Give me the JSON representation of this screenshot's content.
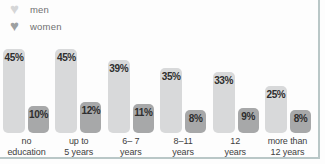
{
  "legend": {
    "items": [
      {
        "label": "men",
        "icon": "heart-icon",
        "color": "#d5d6d7"
      },
      {
        "label": "women",
        "icon": "heart-icon",
        "color": "#9da0a1"
      }
    ]
  },
  "chart_data": {
    "type": "bar",
    "categories": [
      "no education",
      "up to 5 years",
      "6– 7 years",
      "8–11 years",
      "12 years",
      "more than 12 years"
    ],
    "category_lines": [
      [
        "no",
        "education"
      ],
      [
        "up to",
        "5 years"
      ],
      [
        "6– 7",
        "years"
      ],
      [
        "8–11",
        "years"
      ],
      [
        "12",
        "years"
      ],
      [
        "more than",
        "12 years"
      ]
    ],
    "series": [
      {
        "name": "men",
        "values": [
          45,
          45,
          39,
          35,
          33,
          25
        ],
        "labels": [
          "45%",
          "45%",
          "39%",
          "35%",
          "33%",
          "25%"
        ],
        "color": "#d8d9da"
      },
      {
        "name": "women",
        "values": [
          10,
          12,
          11,
          8,
          9,
          8
        ],
        "labels": [
          "10%",
          "12%",
          "11%",
          "8%",
          "9%",
          "8%"
        ],
        "color": "#a7a8a9"
      }
    ],
    "ylim": [
      0,
      50
    ],
    "grid": false,
    "legend_position": "top-left",
    "value_labels_inside_bars": true
  },
  "colors": {
    "background": "#fdfdfd",
    "frame_border": "#b9c7c7",
    "value_text": "#2e2e2e",
    "axis_text": "#3d3d3d",
    "legend_text": "#6f7070"
  }
}
